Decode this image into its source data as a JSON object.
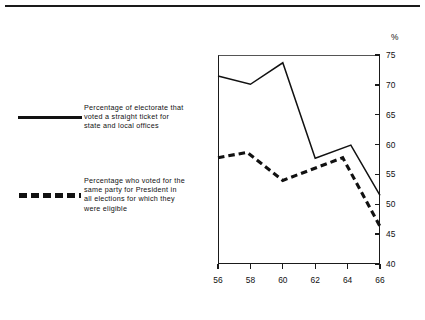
{
  "chart_data": {
    "type": "line",
    "title": "",
    "subtitle": "",
    "xlabel": "",
    "ylabel": "%",
    "unit_label": "%",
    "xlim": [
      56,
      66
    ],
    "ylim": [
      40,
      75
    ],
    "x_ticks": [
      "56",
      "58",
      "60",
      "62",
      "64",
      "66"
    ],
    "y_ticks": [
      "40",
      "45",
      "50",
      "55",
      "60",
      "65",
      "70",
      "75"
    ],
    "grid": false,
    "legend_position": "left",
    "series": [
      {
        "name": "Percentage of electorate that voted a straight ticket for state and local offices",
        "style": "solid",
        "color": "#111111",
        "x": [
          56,
          58,
          60,
          62,
          64.2,
          66
        ],
        "values": [
          71.5,
          70.1,
          73.7,
          57.7,
          59.9,
          51.5
        ]
      },
      {
        "name": "Percentage who voted for the same party for President in all elections for which they were eligible",
        "style": "dashed",
        "color": "#111111",
        "x": [
          56,
          57.8,
          60,
          63.7,
          66
        ],
        "values": [
          57.8,
          58.7,
          54.0,
          57.8,
          46.3
        ]
      }
    ]
  },
  "legend": {
    "entries": [
      {
        "style": "solid",
        "label": "Percentage of electorate that\nvoted a straight ticket for\nstate and local offices"
      },
      {
        "style": "dashed",
        "label": "Percentage who voted for the\nsame party for President in\nall elections for which they\nwere eligible"
      }
    ]
  },
  "axes": {
    "y_unit": "%",
    "y_tick_labels": [
      "75",
      "70",
      "65",
      "60",
      "55",
      "50",
      "45",
      "40"
    ],
    "x_tick_labels": [
      "56",
      "58",
      "60",
      "62",
      "64",
      "66"
    ]
  }
}
